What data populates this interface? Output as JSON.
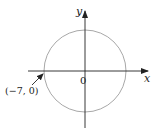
{
  "figure": {
    "type": "circle-on-axes",
    "axes": {
      "x_label": "x",
      "y_label": "y",
      "origin_label": "0"
    },
    "circle": {
      "center": [
        0,
        0
      ],
      "radius": 7,
      "stroke_color": "#a8a8a8"
    },
    "annotation": {
      "point_label": "(−7, 0)",
      "point": [
        -7,
        0
      ],
      "has_arrow": true
    },
    "colors": {
      "axis": "#222222",
      "circle": "#a8a8a8"
    }
  }
}
